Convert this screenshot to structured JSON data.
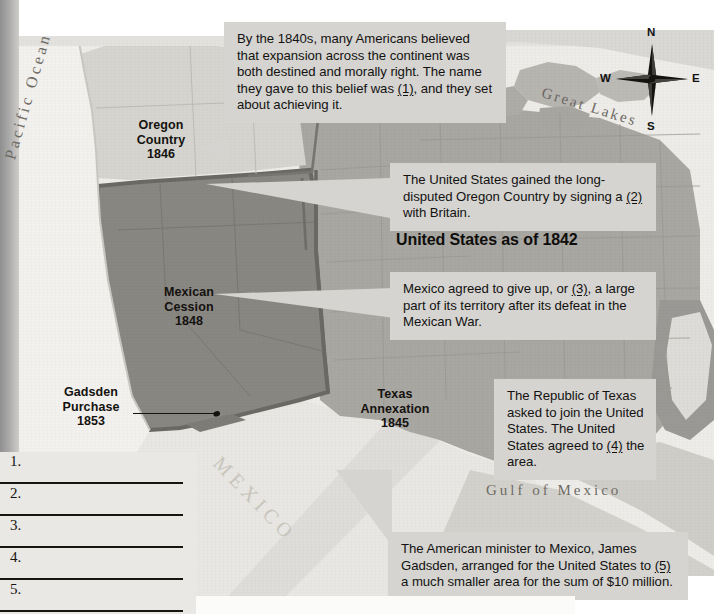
{
  "document": {
    "type": "historical-map-worksheet",
    "title_visible": false
  },
  "map": {
    "legend_heading": "United States as of 1842",
    "regions": [
      {
        "id": "oregon-country",
        "name": "Oregon Country",
        "year": "1846",
        "label": "Oregon\nCountry\n1846"
      },
      {
        "id": "mexican-cession",
        "name": "Mexican Cession",
        "year": "1848",
        "label": "Mexican\nCession\n1848"
      },
      {
        "id": "texas-annexation",
        "name": "Texas Annexation",
        "year": "1845",
        "label": "Texas\nAnnexation\n1845"
      },
      {
        "id": "gadsden-purchase",
        "name": "Gadsden Purchase",
        "year": "1853",
        "label": "Gadsden\nPurchase\n1853"
      }
    ],
    "geography_labels": {
      "pacific_ocean": "Pacific Ocean",
      "great_lakes": "Great Lakes",
      "gulf_of_mexico": "Gulf of Mexico",
      "mexico": "MEXICO"
    },
    "compass": {
      "north": "N",
      "east": "E",
      "south": "S",
      "west": "W"
    },
    "colors": {
      "ocean": "#edece8",
      "united_states_1842": "#a9a7a2",
      "mexican_cession": "#898782",
      "oregon_country": "#d6d4cf",
      "texas": "#a9a7a2",
      "mexico": "#e8e7e3",
      "callout_bg": "#d5d4d0",
      "border": "#6e6c67",
      "text": "#131210"
    }
  },
  "callouts": [
    {
      "id": "manifest-destiny",
      "blank": "(1)",
      "parts": [
        "By the 1840s, many Americans believed that expansion across the continent was both destined and morally right. The name they gave to this belief was ",
        "(1)",
        ", and they set about achieving it."
      ]
    },
    {
      "id": "oregon-treaty",
      "blank": "(2)",
      "parts": [
        "The United States gained the long-disputed Oregon Country by signing a ",
        "(2)",
        " with Britain."
      ]
    },
    {
      "id": "cede-territory",
      "blank": "(3)",
      "parts": [
        "Mexico agreed to give up, or ",
        "(3)",
        ", a large part of its territory after its defeat in the Mexican War."
      ]
    },
    {
      "id": "annex-texas",
      "blank": "(4)",
      "parts": [
        "The Republic of Texas asked to join the United States. The United States agreed to ",
        "(4)",
        " the area."
      ]
    },
    {
      "id": "gadsden-purchase-note",
      "blank": "(5)",
      "parts": [
        "The American minister to Mexico, James Gadsden, arranged for the United States to ",
        "(5)",
        " a much smaller area for the sum of $10 million."
      ]
    }
  ],
  "answer_lines": [
    {
      "number": "1.",
      "value": ""
    },
    {
      "number": "2.",
      "value": ""
    },
    {
      "number": "3.",
      "value": ""
    },
    {
      "number": "4.",
      "value": ""
    },
    {
      "number": "5.",
      "value": ""
    }
  ]
}
